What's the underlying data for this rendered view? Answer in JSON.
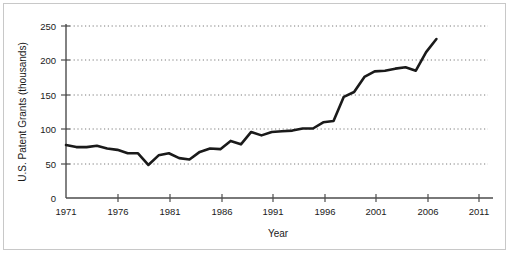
{
  "chart_data": {
    "type": "line",
    "title": "",
    "xlabel": "Year",
    "ylabel": "U.S. Patent Grants (thousands)",
    "xlim": [
      1971,
      2012.5
    ],
    "ylim": [
      0,
      250
    ],
    "xticks": [
      1971,
      1976,
      1981,
      1986,
      1991,
      1996,
      2001,
      2006,
      2011
    ],
    "xticklabels": [
      "1971",
      "1976",
      "1981",
      "1986",
      "1991",
      "1996",
      "2001",
      "2006",
      "2011"
    ],
    "yticks": [
      0,
      50,
      100,
      150,
      200,
      250
    ],
    "yticklabels": [
      "0",
      "50",
      "100",
      "150",
      "200",
      "250"
    ],
    "grid": "horizontal-dotted",
    "legend": "none",
    "line_color": "#1a1a1a",
    "line_width": 2.6,
    "x": [
      1971,
      1972,
      1973,
      1974,
      1975,
      1976,
      1977,
      1978,
      1979,
      1980,
      1981,
      1982,
      1983,
      1984,
      1985,
      1986,
      1987,
      1988,
      1989,
      1990,
      1991,
      1992,
      1993,
      1994,
      1995,
      1996,
      1997,
      1998,
      1999,
      2000,
      2001,
      2002,
      2003,
      2004,
      2005,
      2006,
      2007
    ],
    "values": [
      78,
      74,
      74,
      76,
      72,
      70,
      65,
      66,
      48,
      62,
      65,
      58,
      56,
      67,
      72,
      71,
      83,
      78,
      95,
      90,
      96,
      97,
      98,
      101,
      101,
      110,
      112,
      147,
      154,
      176,
      184,
      184,
      187,
      181,
      157,
      173,
      182
    ],
    "series": [
      {
        "name": "U.S. Patent Grants",
        "x": [
          1971,
          1972,
          1973,
          1974,
          1975,
          1976,
          1977,
          1978,
          1979,
          1980,
          1981,
          1982,
          1983,
          1984,
          1985,
          1986,
          1987,
          1988,
          1989,
          1990,
          1991,
          1992,
          1993,
          1994,
          1995,
          1996,
          1997,
          1998,
          1999,
          2000,
          2001,
          2002,
          2003,
          2004,
          2005,
          2006,
          2007
        ],
        "values": [
          77,
          74,
          74,
          76,
          72,
          70,
          65,
          65,
          48,
          62,
          65,
          58,
          56,
          67,
          72,
          71,
          83,
          78,
          96,
          91,
          96,
          97,
          98,
          101,
          101,
          110,
          112,
          147,
          154,
          176,
          184,
          185,
          188,
          190,
          185,
          212,
          231
        ]
      }
    ],
    "annotations": []
  },
  "axes": {
    "y_axis_title": "U.S. Patent Grants (thousands)",
    "x_axis_title": "Year"
  }
}
